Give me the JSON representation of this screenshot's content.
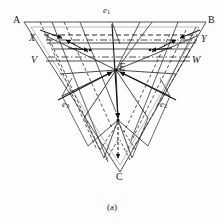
{
  "figure": {
    "caption": "(a)",
    "type": "geometry-diagram",
    "background_color": "#fdfdfd",
    "stroke_color": "#1a1a1a"
  },
  "labels": {
    "vertex_a": "A",
    "vertex_b": "B",
    "vertex_c": "C",
    "point_x": "X",
    "point_y": "Y",
    "point_v": "V",
    "point_w": "W",
    "point_e": "E",
    "vector_e1_base": "e",
    "vector_e1_sub": "1",
    "vector_e2_base": "e",
    "vector_e2_sub": "2",
    "vector_e3_base": "e",
    "vector_e3_sub": "3"
  },
  "geometry": {
    "triangle": {
      "A": [
        24,
        22
      ],
      "B": [
        206,
        22
      ],
      "C": [
        120,
        172
      ]
    },
    "center_E": [
      116,
      70
    ],
    "chord_XY": {
      "X": [
        47,
        38
      ],
      "Y": [
        196,
        38
      ]
    },
    "chord_VW": {
      "V": [
        46,
        60
      ],
      "W": [
        190,
        60
      ]
    },
    "vectors": [
      {
        "name": "e1",
        "from": [
          112,
          24
        ],
        "to": [
          118,
          120
        ]
      },
      {
        "name": "e2",
        "from": [
          170,
          92
        ],
        "to": [
          116,
          70
        ]
      },
      {
        "name": "e3",
        "from": [
          64,
          92
        ],
        "to": [
          116,
          70
        ]
      }
    ],
    "line_styles": {
      "outline": "solid",
      "construction": "dashed",
      "axis": "dash-dot",
      "chord": "solid"
    }
  }
}
